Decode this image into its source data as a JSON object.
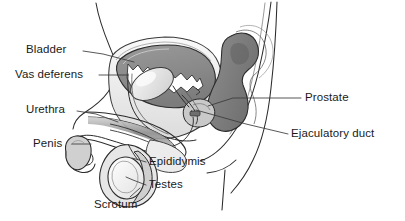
{
  "diagram": {
    "type": "anatomical-line-diagram",
    "width": 405,
    "height": 221,
    "background_color": "#ffffff",
    "line_color": "#2b2b2b",
    "palette": {
      "outline": "#2b2b2b",
      "bladder_fill": "#8c8c8c",
      "bladder_lumen": "#ffffff",
      "rectum_fill": "#7d7d7d",
      "tissue_light": "#ededed",
      "tissue_mid": "#d6d6d6",
      "tissue_dark": "#b4b4b4",
      "prostate_fill": "#c9c9c9",
      "testis_fill": "#f2f2f2",
      "leader_line": "#3a3a3a"
    }
  },
  "labels": {
    "bladder": {
      "text": "Bladder",
      "side": "left",
      "x": 26,
      "y": 43,
      "leader": "M 84 50 L 112 58"
    },
    "vas_deferens": {
      "text": "Vas deferens",
      "side": "left",
      "x": 15,
      "y": 68,
      "leader": "M 100 75 L 128 75"
    },
    "urethra": {
      "text": "Urethra",
      "side": "left",
      "x": 26,
      "y": 103,
      "leader": "M 78 110 L 110 118"
    },
    "penis": {
      "text": "Penis",
      "side": "left",
      "x": 33,
      "y": 137,
      "leader": "M 73 143 L 92 143"
    },
    "prostate": {
      "text": "Prostate",
      "side": "right",
      "x": 305,
      "y": 91,
      "leader": "M 300 98 L 232 98"
    },
    "ejaculatory_duct": {
      "text": "Ejaculatory duct",
      "side": "right",
      "x": 291,
      "y": 127,
      "leader": "M 288 134 L 196 112"
    },
    "epididymis": {
      "text": "Epididymis",
      "side": "right",
      "x": 148,
      "y": 156,
      "leader": "M 145 162 L 122 157"
    },
    "testes": {
      "text": "Testes",
      "side": "right",
      "x": 148,
      "y": 179,
      "leader": "M 145 185 L 120 178"
    },
    "scrotum": {
      "text": "Scrotum",
      "side": "right",
      "x": 94,
      "y": 198,
      "leader": "M 120 199 L 133 191"
    }
  }
}
